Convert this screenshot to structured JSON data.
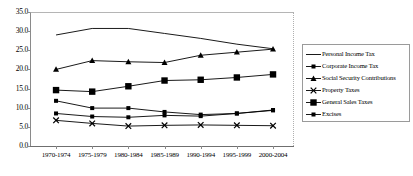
{
  "chart_data": {
    "type": "line",
    "title": "",
    "xlabel": "",
    "ylabel": "",
    "ylim": [
      0.0,
      35.0
    ],
    "yticks": [
      "0.0",
      "5.0",
      "10.0",
      "15.0",
      "20.0",
      "25.0",
      "30.0",
      "35.0"
    ],
    "grid": false,
    "legend_position": "right",
    "categories": [
      "1970-1974",
      "1975-1979",
      "1980-1984",
      "1985-1989",
      "1990-1994",
      "1995-1999",
      "2000-2004"
    ],
    "series": [
      {
        "name": "Personal Income Tax",
        "marker": "none",
        "color": "#000000",
        "values": [
          29.0,
          30.7,
          30.7,
          29.4,
          28.1,
          26.6,
          25.4
        ]
      },
      {
        "name": "Corporate Income Tax",
        "marker": "small-square",
        "color": "#000000",
        "values": [
          11.8,
          9.9,
          9.9,
          8.9,
          8.2,
          8.5,
          9.4
        ]
      },
      {
        "name": "Social Security Contributions",
        "marker": "triangle",
        "color": "#000000",
        "values": [
          20.0,
          22.3,
          22.0,
          21.8,
          23.7,
          24.5,
          25.3
        ]
      },
      {
        "name": "Property Taxes",
        "marker": "x",
        "color": "#000000",
        "values": [
          6.7,
          5.9,
          5.2,
          5.4,
          5.5,
          5.4,
          5.3
        ]
      },
      {
        "name": "General Sales Taxes",
        "marker": "large-square",
        "color": "#000000",
        "values": [
          14.6,
          14.2,
          15.6,
          17.1,
          17.3,
          17.9,
          18.7
        ]
      },
      {
        "name": "Excises",
        "marker": "small-square",
        "color": "#000000",
        "values": [
          8.5,
          7.7,
          7.5,
          8.0,
          7.8,
          8.5,
          9.3
        ]
      }
    ]
  }
}
